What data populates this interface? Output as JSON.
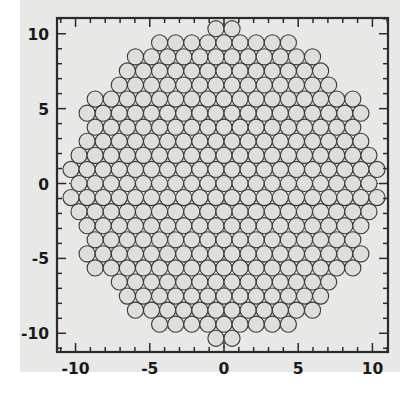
{
  "figure": {
    "type": "scatter-packing",
    "background_color": "#e8e8e6",
    "frame_color": "#2b2b2b",
    "circle_fill": "#dededa",
    "circle_stroke": "#3a3a3a",
    "guide_color": "#2b2b2b"
  },
  "chart_data": {
    "type": "scatter",
    "title": "",
    "subtitle": "",
    "xlabel": "",
    "ylabel": "",
    "grid": false,
    "legend": null,
    "legend_position": "none",
    "xlim": [
      -11.25,
      11.05
    ],
    "ylim": [
      -11.25,
      11.05
    ],
    "xticks": [
      -10,
      -5,
      0,
      5,
      10
    ],
    "xticklabels": [
      "-10",
      "-5",
      "0",
      "5",
      "10"
    ],
    "yticks": [
      -10,
      -5,
      0,
      5,
      10
    ],
    "yticklabels": [
      "10",
      "5",
      "0",
      "-5",
      "-10"
    ],
    "minor_tick_step": 1,
    "annotations": [
      {
        "kind": "dotted-line",
        "orientation": "horizontal",
        "value": 0
      },
      {
        "kind": "dotted-line",
        "orientation": "vertical",
        "value": 0
      }
    ],
    "marker": {
      "shape": "circle",
      "diameter": 1.085,
      "filled": true,
      "fill": "#dededa",
      "edge": "#3a3a3a",
      "edge_width": 1.1
    },
    "lattice": {
      "arrangement": "hexagonal-close-packed",
      "column_pitch": 1.085,
      "row_pitch": 0.9395,
      "row_offset": 0.5425,
      "boundary": "circular",
      "boundary_radius": 10.45,
      "center": [
        0,
        0
      ],
      "rows": 23,
      "count": 397
    },
    "x": [],
    "y": []
  },
  "axes": {
    "x_axis_name": "x-axis",
    "y_axis_name": "y-axis"
  }
}
